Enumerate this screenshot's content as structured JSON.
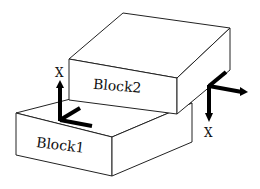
{
  "diagram": {
    "type": "3d-stacked-blocks",
    "colors": {
      "background": "#ffffff",
      "line": "#222222",
      "axis": "#000000"
    },
    "blocks": [
      {
        "id": "block1",
        "label": "Block1"
      },
      {
        "id": "block2",
        "label": "Block2"
      }
    ],
    "frames": [
      {
        "id": "frame-block1",
        "axis_label": "X",
        "x_direction": "up"
      },
      {
        "id": "frame-block2",
        "axis_label": "X",
        "x_direction": "down"
      }
    ]
  }
}
